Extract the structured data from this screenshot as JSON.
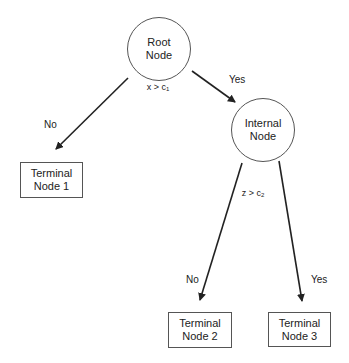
{
  "diagram": {
    "type": "decision-tree",
    "nodes": {
      "root": {
        "line1": "Root",
        "line2": "Node",
        "shape": "circle"
      },
      "internal": {
        "line1": "Internal",
        "line2": "Node",
        "shape": "circle"
      },
      "terminal1": {
        "line1": "Terminal",
        "line2": "Node 1",
        "shape": "box"
      },
      "terminal2": {
        "line1": "Terminal",
        "line2": "Node 2",
        "shape": "box"
      },
      "terminal3": {
        "line1": "Terminal",
        "line2": "Node 3",
        "shape": "box"
      }
    },
    "splits": {
      "root": {
        "var": "x",
        "op": ">",
        "const": "c",
        "sub": "1"
      },
      "internal": {
        "var": "z",
        "op": ">",
        "const": "c",
        "sub": "2"
      }
    },
    "edges": [
      {
        "from": "root",
        "to": "terminal1",
        "label": "No"
      },
      {
        "from": "root",
        "to": "internal",
        "label": "Yes"
      },
      {
        "from": "internal",
        "to": "terminal2",
        "label": "No"
      },
      {
        "from": "internal",
        "to": "terminal3",
        "label": "Yes"
      }
    ],
    "stroke_color": "#222222"
  }
}
